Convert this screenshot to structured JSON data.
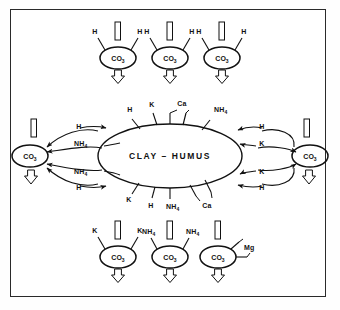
{
  "figure": {
    "title_center": "CLAY – HUMUS",
    "frame_color": "#2a2a2a",
    "ink_color": "#111111",
    "background": "#ffffff",
    "molecule_label": "CO",
    "molecule_subscript": "3",
    "nh4_label": "NH",
    "nh4_subscript": "4",
    "h_label": "H",
    "k_label": "K",
    "ca_label": "Ca",
    "mg_label": "Mg"
  },
  "core": {
    "label": "CLAY – HUMUS",
    "top_ions": [
      "H",
      "K",
      "Ca",
      "NH4"
    ],
    "bottom_ions": [
      "K",
      "H",
      "NH4",
      "Ca"
    ]
  },
  "top_row": [
    {
      "molecule": "CO3",
      "left_ion": "H",
      "right_ion": "H",
      "in_arrow": "down-shaft",
      "out_arrow": "down-arrow"
    },
    {
      "molecule": "CO3",
      "left_ion": "H",
      "right_ion": "H",
      "in_arrow": "down-shaft",
      "out_arrow": "down-arrow"
    },
    {
      "molecule": "CO3",
      "left_ion": "H",
      "right_ion": "H",
      "in_arrow": "down-shaft",
      "out_arrow": "down-arrow"
    }
  ],
  "bottom_row": [
    {
      "molecule": "CO3",
      "left_ion": "K",
      "right_ion": "K",
      "in_arrow": "down-shaft",
      "out_arrow": "down-arrow"
    },
    {
      "molecule": "CO3",
      "left_ion": "NH4",
      "right_ion": "NH4",
      "in_arrow": "down-shaft",
      "out_arrow": "down-arrow"
    },
    {
      "molecule": "CO3",
      "left_ion": "Mg",
      "right_ion": "",
      "divalent": true,
      "in_arrow": "down-shaft",
      "out_arrow": "down-arrow"
    }
  ],
  "left_side": {
    "molecule": "CO3",
    "in_arrow": "down-shaft",
    "out_arrow": "down-arrow",
    "exchange_labels": [
      "H",
      "NH4",
      "NH4",
      "H"
    ]
  },
  "right_side": {
    "molecule": "CO3",
    "in_arrow": "down-shaft",
    "out_arrow": "down-arrow",
    "exchange_labels": [
      "H",
      "K",
      "K",
      "H"
    ]
  }
}
